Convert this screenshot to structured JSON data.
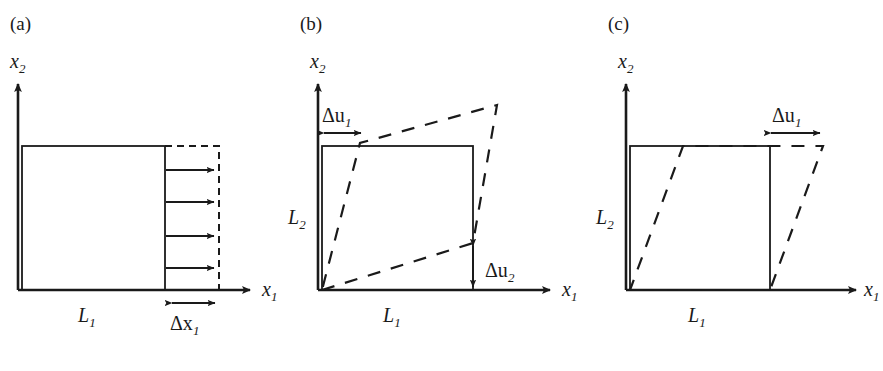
{
  "figure": {
    "background_color": "#ffffff",
    "line_color": "#1a1a1a"
  },
  "panels": [
    {
      "tag": "(a)",
      "tag_pos": {
        "x": 10,
        "y": 30
      },
      "kind": "uniaxial-extension",
      "axes": {
        "x_label": "x",
        "x_sub": "1",
        "y_label": "x",
        "y_sub": "2",
        "origin": {
          "x": 18,
          "y": 290
        },
        "x_tip": {
          "x": 256,
          "y": 290
        },
        "y_tip": {
          "x": 18,
          "y": 78
        },
        "x_label_pos": {
          "x": 262,
          "y": 296
        },
        "y_label_pos": {
          "x": 10,
          "y": 68
        }
      },
      "solid_square": {
        "x": 22,
        "y": 146,
        "w": 143,
        "h": 144
      },
      "dashed_region": {
        "x": 165,
        "y": 146,
        "w": 54,
        "h": 144
      },
      "arrows": {
        "count": 4,
        "x_start": 166,
        "x_end": 219,
        "ys": [
          170,
          202,
          236,
          268
        ]
      },
      "labels": [
        {
          "name": "L1",
          "base": "L",
          "sub": "1",
          "x": 78,
          "y": 322
        },
        {
          "name": "dx1",
          "base": "Δx",
          "sub": "1",
          "x": 172,
          "y": 330
        }
      ],
      "dim_arrow": {
        "x1": 168,
        "x2": 219,
        "y": 303
      }
    },
    {
      "tag": "(b)",
      "tag_pos": {
        "x": 300,
        "y": 30
      },
      "kind": "shear-plus-rotation",
      "axes": {
        "x_label": "x",
        "x_sub": "1",
        "y_label": "x",
        "y_sub": "2",
        "origin": {
          "x": 318,
          "y": 290
        },
        "x_tip": {
          "x": 556,
          "y": 290
        },
        "y_tip": {
          "x": 318,
          "y": 78
        },
        "x_label_pos": {
          "x": 562,
          "y": 296
        },
        "y_label_pos": {
          "x": 310,
          "y": 68
        }
      },
      "solid_square": {
        "x": 322,
        "y": 146,
        "w": 151,
        "h": 144
      },
      "dashed_quad": [
        {
          "x": 322,
          "y": 290
        },
        {
          "x": 473,
          "y": 243
        },
        {
          "x": 497,
          "y": 105
        },
        {
          "x": 360,
          "y": 143
        }
      ],
      "labels": [
        {
          "name": "L2",
          "base": "L",
          "sub": "2",
          "x": 288,
          "y": 224
        },
        {
          "name": "L1",
          "base": "L",
          "sub": "1",
          "x": 383,
          "y": 322
        },
        {
          "name": "du1",
          "base": "Δu",
          "sub": "1",
          "x": 322,
          "y": 122
        },
        {
          "name": "du2",
          "base": "Δu",
          "sub": "2",
          "x": 487,
          "y": 277
        }
      ],
      "dim_arrow_h": {
        "x1": 322,
        "x2": 364,
        "y": 133
      },
      "dim_arrow_v": {
        "x": 473,
        "y1": 243,
        "y2": 290
      }
    },
    {
      "tag": "(c)",
      "tag_pos": {
        "x": 608,
        "y": 30
      },
      "kind": "pure-shear",
      "axes": {
        "x_label": "x",
        "x_sub": "1",
        "y_label": "x",
        "y_sub": "2",
        "origin": {
          "x": 626,
          "y": 290
        },
        "x_tip": {
          "x": 862,
          "y": 290
        },
        "y_tip": {
          "x": 626,
          "y": 78
        },
        "x_label_pos": {
          "x": 866,
          "y": 296
        },
        "y_label_pos": {
          "x": 618,
          "y": 68
        }
      },
      "solid_square": {
        "x": 630,
        "y": 146,
        "w": 140,
        "h": 144
      },
      "dashed_quad": [
        {
          "x": 630,
          "y": 290
        },
        {
          "x": 770,
          "y": 290
        },
        {
          "x": 823,
          "y": 146
        },
        {
          "x": 683,
          "y": 146
        }
      ],
      "labels": [
        {
          "name": "L2",
          "base": "L",
          "sub": "2",
          "x": 596,
          "y": 224
        },
        {
          "name": "L1",
          "base": "L",
          "sub": "1",
          "x": 688,
          "y": 322
        },
        {
          "name": "du1",
          "base": "Δu",
          "sub": "1",
          "x": 772,
          "y": 122
        }
      ],
      "dim_arrow_h": {
        "x1": 769,
        "x2": 823,
        "y": 133
      }
    }
  ]
}
